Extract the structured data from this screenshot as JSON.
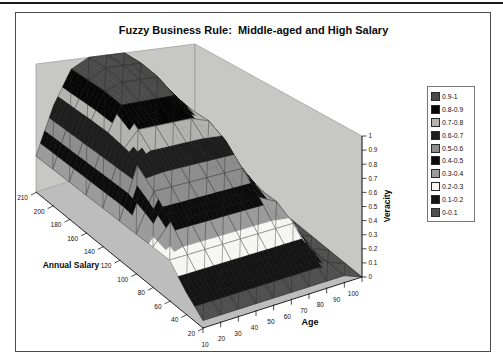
{
  "chart": {
    "title": "Fuzzy Business Rule:  Middle-aged and High Salary",
    "x_axis": {
      "title": "Age",
      "labels": [
        "10",
        "20",
        "30",
        "40",
        "50",
        "60",
        "70",
        "80",
        "90",
        "100"
      ]
    },
    "y_axis": {
      "title": "Annual Salary",
      "labels": [
        "20",
        "40",
        "60",
        "80",
        "100",
        "120",
        "140",
        "160",
        "180",
        "200",
        "210"
      ]
    },
    "z_axis": {
      "title": "Veracity",
      "labels": [
        "0",
        "0.1",
        "0.2",
        "0.3",
        "0.4",
        "0.5",
        "0.6",
        "0.7",
        "0.8",
        "0.9",
        "1"
      ]
    },
    "legend": {
      "position": "right",
      "items": [
        {
          "label": "0.9-1",
          "color": "#4a4a4a"
        },
        {
          "label": "0.8-0.9",
          "color": "#060606"
        },
        {
          "label": "0.7-0.8",
          "color": "#b3b3b0"
        },
        {
          "label": "0.6-0.7",
          "color": "#1e1e1e"
        },
        {
          "label": "0.5-0.6",
          "color": "#8d8d8d"
        },
        {
          "label": "0.4-0.5",
          "color": "#0c0c0c"
        },
        {
          "label": "0.3-0.4",
          "color": "#9b9b9b"
        },
        {
          "label": "0.2-0.3",
          "color": "#f7f7f4"
        },
        {
          "label": "0.1-0.2",
          "color": "#141414"
        },
        {
          "label": "0-0.1",
          "color": "#4f4f4f"
        }
      ]
    }
  },
  "chart_data": {
    "type": "surface",
    "title": "Fuzzy Business Rule:  Middle-aged and High Salary",
    "xlabel": "Age",
    "ylabel": "Annual Salary",
    "zlabel": "Veracity",
    "x": [
      10,
      20,
      30,
      40,
      50,
      60,
      70,
      80,
      90,
      100
    ],
    "y": [
      20,
      40,
      60,
      80,
      100,
      120,
      140,
      160,
      180,
      200,
      210
    ],
    "zlim": [
      0,
      1
    ],
    "bands": [
      {
        "range": "0-0.1",
        "color": "#4f4f4f"
      },
      {
        "range": "0.1-0.2",
        "color": "#141414"
      },
      {
        "range": "0.2-0.3",
        "color": "#f7f7f4"
      },
      {
        "range": "0.3-0.4",
        "color": "#9b9b9b"
      },
      {
        "range": "0.4-0.5",
        "color": "#0c0c0c"
      },
      {
        "range": "0.5-0.6",
        "color": "#8d8d8d"
      },
      {
        "range": "0.6-0.7",
        "color": "#1e1e1e"
      },
      {
        "range": "0.7-0.8",
        "color": "#b3b3b0"
      },
      {
        "range": "0.8-0.9",
        "color": "#060606"
      },
      {
        "range": "0.9-1",
        "color": "#4a4a4a"
      }
    ],
    "z_grid_rows_by_salary": [
      [
        0.05,
        0.05,
        0.05,
        0.05,
        0.05,
        0.05,
        0.05,
        0.05,
        0.05,
        0
      ],
      [
        0.15,
        0.15,
        0.15,
        0.15,
        0.15,
        0.15,
        0.15,
        0.15,
        0.05,
        0
      ],
      [
        0.28,
        0.28,
        0.28,
        0.28,
        0.28,
        0.28,
        0.28,
        0.28,
        0.05,
        0
      ],
      [
        0.28,
        0.42,
        0.42,
        0.42,
        0.42,
        0.42,
        0.42,
        0.35,
        0.05,
        0
      ],
      [
        0.28,
        0.55,
        0.55,
        0.55,
        0.55,
        0.55,
        0.55,
        0.35,
        0.05,
        0
      ],
      [
        0.28,
        0.65,
        0.68,
        0.68,
        0.68,
        0.68,
        0.68,
        0.35,
        0.05,
        0
      ],
      [
        0.28,
        0.65,
        0.8,
        0.8,
        0.8,
        0.8,
        0.75,
        0.35,
        0.05,
        0
      ],
      [
        0.28,
        0.65,
        0.9,
        0.9,
        0.9,
        0.9,
        0.75,
        0.35,
        0.05,
        0
      ],
      [
        0.28,
        0.65,
        0.92,
        0.97,
        0.97,
        0.97,
        0.75,
        0.35,
        0.05,
        0
      ],
      [
        0.28,
        0.65,
        0.92,
        1,
        1,
        1,
        0.75,
        0.35,
        0.05,
        0
      ],
      [
        0.28,
        0.65,
        0.92,
        1,
        1,
        1,
        0.75,
        0.35,
        0.05,
        0
      ]
    ],
    "wall_color": "#c7c7c6",
    "floor_color": "#bdbdbd",
    "mesh_color": "#1f1f1f"
  }
}
